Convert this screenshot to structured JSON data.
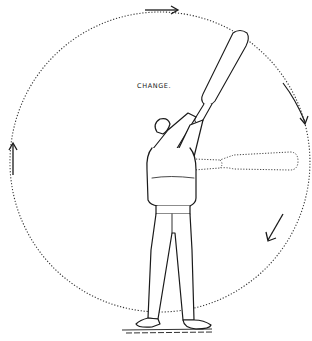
{
  "illustration": {
    "title_label": "CHANGE.",
    "subject": "man-swinging-indian-club",
    "path": {
      "shape": "dotted-circle",
      "center": [
        160,
        178
      ],
      "radius": 150,
      "stroke_color": "#333333"
    },
    "arrows": [
      {
        "name": "top-arrow",
        "position": [
          175,
          10
        ],
        "direction": "right"
      },
      {
        "name": "right-upper-arrow",
        "position": [
          302,
          112
        ],
        "direction": "down"
      },
      {
        "name": "right-lower-arrow",
        "position": [
          268,
          234
        ],
        "direction": "down-left"
      },
      {
        "name": "left-arrow",
        "position": [
          12,
          145
        ],
        "direction": "up"
      }
    ],
    "club_positions": [
      {
        "name": "club-raised",
        "style": "solid"
      },
      {
        "name": "club-horizontal",
        "style": "dotted"
      }
    ],
    "ink_color": "#1a1a1a",
    "background_color": "#ffffff"
  }
}
